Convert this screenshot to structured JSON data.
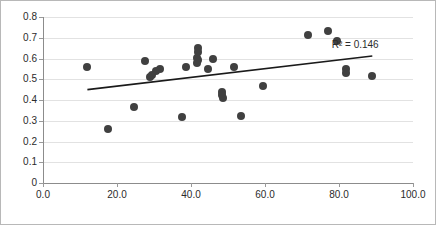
{
  "chart_data": {
    "type": "scatter",
    "title": "",
    "xlabel": "",
    "ylabel": "",
    "xlim": [
      0.0,
      100.0
    ],
    "ylim": [
      0.0,
      0.8
    ],
    "xticks": [
      "0.0",
      "20.0",
      "40.0",
      "60.0",
      "80.0",
      "100.0"
    ],
    "xtick_values": [
      0,
      20,
      40,
      60,
      80,
      100
    ],
    "yticks": [
      "0",
      "0.1",
      "0.2",
      "0.3",
      "0.4",
      "0.5",
      "0.6",
      "0.7",
      "0.8"
    ],
    "ytick_values": [
      0,
      0.1,
      0.2,
      0.3,
      0.4,
      0.5,
      0.6,
      0.7,
      0.8
    ],
    "grid": "horizontal",
    "legend": "none",
    "marker_color": "#404040",
    "marker_shape": "circle",
    "points": [
      {
        "x": 12.0,
        "y": 0.56
      },
      {
        "x": 17.5,
        "y": 0.26
      },
      {
        "x": 24.5,
        "y": 0.368
      },
      {
        "x": 27.5,
        "y": 0.59
      },
      {
        "x": 29.0,
        "y": 0.512
      },
      {
        "x": 29.5,
        "y": 0.522
      },
      {
        "x": 30.5,
        "y": 0.542
      },
      {
        "x": 31.5,
        "y": 0.55
      },
      {
        "x": 37.5,
        "y": 0.318
      },
      {
        "x": 38.5,
        "y": 0.558
      },
      {
        "x": 41.8,
        "y": 0.65
      },
      {
        "x": 42.0,
        "y": 0.632
      },
      {
        "x": 41.5,
        "y": 0.605
      },
      {
        "x": 42.0,
        "y": 0.592
      },
      {
        "x": 41.5,
        "y": 0.578
      },
      {
        "x": 44.5,
        "y": 0.548
      },
      {
        "x": 46.0,
        "y": 0.598
      },
      {
        "x": 48.5,
        "y": 0.44
      },
      {
        "x": 48.5,
        "y": 0.424
      },
      {
        "x": 48.7,
        "y": 0.408
      },
      {
        "x": 51.5,
        "y": 0.558
      },
      {
        "x": 53.5,
        "y": 0.325
      },
      {
        "x": 59.5,
        "y": 0.468
      },
      {
        "x": 71.5,
        "y": 0.715
      },
      {
        "x": 77.0,
        "y": 0.735
      },
      {
        "x": 79.5,
        "y": 0.685
      },
      {
        "x": 82.0,
        "y": 0.548
      },
      {
        "x": 82.0,
        "y": 0.53
      },
      {
        "x": 89.0,
        "y": 0.516
      }
    ],
    "trendline": {
      "type": "linear",
      "color": "#1a1a1a",
      "x_start": 12.0,
      "y_start": 0.45,
      "x_end": 89.0,
      "y_end": 0.612
    },
    "annotations": [
      {
        "name": "r-squared",
        "text": "R² = 0.146",
        "x": 91.0,
        "y": 0.665
      }
    ]
  }
}
